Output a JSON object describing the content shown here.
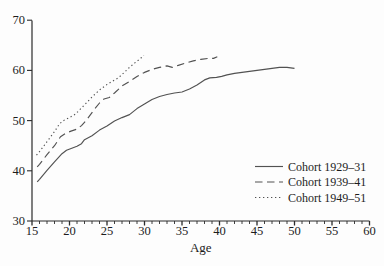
{
  "figure": {
    "background": "#fdfdfd",
    "text_color": "#1c1c1c",
    "axis_color": "#2b2b2b",
    "line_color": "#525252"
  },
  "chart_data": {
    "type": "line",
    "title": "",
    "xlabel": "Age",
    "ylabel": "",
    "xlim": [
      15,
      60
    ],
    "ylim": [
      30,
      70
    ],
    "x_major_ticks": [
      15,
      20,
      25,
      30,
      35,
      40,
      45,
      50,
      55,
      60
    ],
    "x_minor_tick_step": 1,
    "y_ticks": [
      30,
      40,
      50,
      60,
      70
    ],
    "grid": false,
    "legend_position": "lower right",
    "series": [
      {
        "name": "Cohort 1929–31",
        "style": "solid",
        "points": [
          [
            15.7,
            37.8
          ],
          [
            16,
            38.3
          ],
          [
            17,
            40.1
          ],
          [
            18,
            41.8
          ],
          [
            19,
            43.4
          ],
          [
            19.6,
            44.1
          ],
          [
            20.3,
            44.5
          ],
          [
            21,
            44.9
          ],
          [
            21.6,
            45.4
          ],
          [
            22,
            46.2
          ],
          [
            23,
            47.0
          ],
          [
            24,
            48.1
          ],
          [
            25,
            48.9
          ],
          [
            26,
            49.9
          ],
          [
            27,
            50.6
          ],
          [
            28,
            51.2
          ],
          [
            29,
            52.4
          ],
          [
            30,
            53.3
          ],
          [
            31,
            54.2
          ],
          [
            32,
            54.8
          ],
          [
            33,
            55.2
          ],
          [
            34,
            55.5
          ],
          [
            35,
            55.7
          ],
          [
            36,
            56.3
          ],
          [
            37,
            57.1
          ],
          [
            38,
            58.1
          ],
          [
            38.7,
            58.5
          ],
          [
            39.6,
            58.6
          ],
          [
            40.3,
            58.8
          ],
          [
            41,
            59.1
          ],
          [
            42,
            59.4
          ],
          [
            43,
            59.6
          ],
          [
            44,
            59.8
          ],
          [
            45,
            60.0
          ],
          [
            46,
            60.2
          ],
          [
            47,
            60.4
          ],
          [
            48,
            60.6
          ],
          [
            49,
            60.6
          ],
          [
            50,
            60.4
          ]
        ]
      },
      {
        "name": "Cohort 1939–41",
        "style": "dashed",
        "points": [
          [
            15.7,
            40.8
          ],
          [
            16,
            41.3
          ],
          [
            17,
            43.2
          ],
          [
            18,
            45.0
          ],
          [
            18.8,
            46.8
          ],
          [
            19.5,
            47.5
          ],
          [
            20.2,
            47.9
          ],
          [
            21,
            48.3
          ],
          [
            21.6,
            49.0
          ],
          [
            22.2,
            50.0
          ],
          [
            22.8,
            51.2
          ],
          [
            23.4,
            52.4
          ],
          [
            24,
            53.5
          ],
          [
            24.6,
            54.3
          ],
          [
            25.3,
            54.6
          ],
          [
            26,
            55.5
          ],
          [
            27,
            56.9
          ],
          [
            28,
            57.8
          ],
          [
            29,
            58.8
          ],
          [
            30,
            59.6
          ],
          [
            31,
            60.2
          ],
          [
            32,
            60.6
          ],
          [
            33,
            60.9
          ],
          [
            33.7,
            60.6
          ],
          [
            34.5,
            61.0
          ],
          [
            35.5,
            61.5
          ],
          [
            36.5,
            61.9
          ],
          [
            37.5,
            62.2
          ],
          [
            38.5,
            62.4
          ],
          [
            39.2,
            62.4
          ],
          [
            39.7,
            62.7
          ]
        ]
      },
      {
        "name": "Cohort 1949–51",
        "style": "dotted",
        "points": [
          [
            15.6,
            43.1
          ],
          [
            16,
            43.8
          ],
          [
            17,
            45.8
          ],
          [
            18,
            47.8
          ],
          [
            18.7,
            49.4
          ],
          [
            19.3,
            50.1
          ],
          [
            20,
            50.6
          ],
          [
            20.8,
            51.3
          ],
          [
            21.5,
            52.4
          ],
          [
            22.3,
            53.6
          ],
          [
            23,
            54.7
          ],
          [
            24,
            56.1
          ],
          [
            25,
            57.2
          ],
          [
            25.8,
            57.9
          ],
          [
            26.5,
            58.5
          ],
          [
            27.3,
            59.6
          ],
          [
            28,
            60.6
          ],
          [
            28.7,
            61.5
          ],
          [
            29.4,
            62.3
          ],
          [
            29.9,
            63.0
          ]
        ]
      }
    ]
  }
}
